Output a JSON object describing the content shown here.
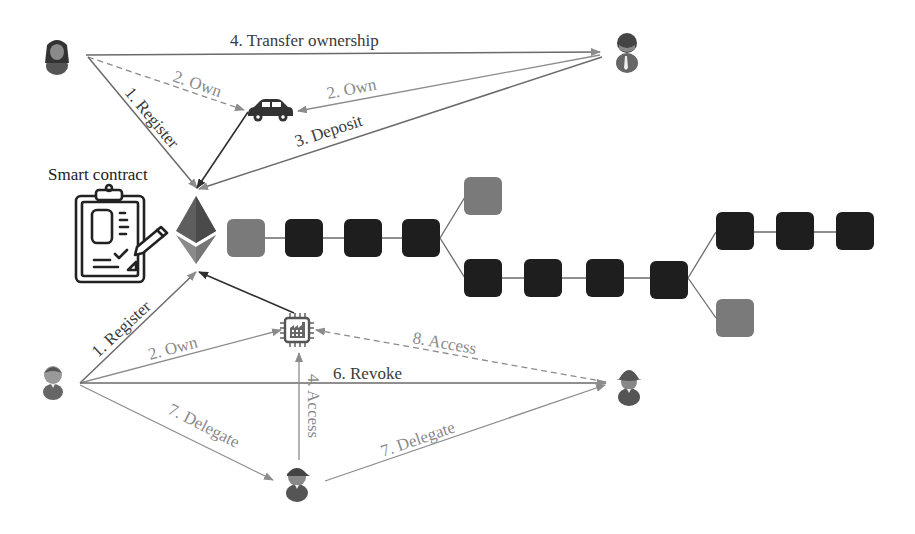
{
  "title": "Smart contract",
  "colors": {
    "dark_edge": "#2f2f2f",
    "gray_edge": "#8c8c8c",
    "block_main": "#1e1e1e",
    "block_orphan": "#7a7a7a",
    "eth_top": "#6e6e6e",
    "eth_bottom": "#8a8a8a"
  },
  "labels": {
    "transfer": "4. Transfer ownership",
    "own_a": "2. Own",
    "own_b": "2. Own",
    "register_top": "1. Register",
    "deposit": "3. Deposit",
    "smart_contract": "Smart contract",
    "register_bottom": "1. Register",
    "own_c": "2. Own",
    "access_8": "8. Access",
    "revoke": "6. Revoke",
    "access_4": "4. Access",
    "delegate_a": "7. Delegate",
    "delegate_b": "7. Delegate"
  },
  "icons": {
    "user_top_left": "user-female-icon",
    "user_top_right": "user-male-tie-icon",
    "car": "car-icon",
    "contract": "clipboard-contract-icon",
    "ethereum": "ethereum-icon",
    "iot": "iot-chip-factory-icon",
    "user_bottom_left": "user-male-icon",
    "user_bottom_mid": "user-cap-icon",
    "user_bottom_right": "user-hat-icon"
  },
  "blockchain": {
    "main_chain_blocks": 11,
    "orphan_blocks": 2
  }
}
